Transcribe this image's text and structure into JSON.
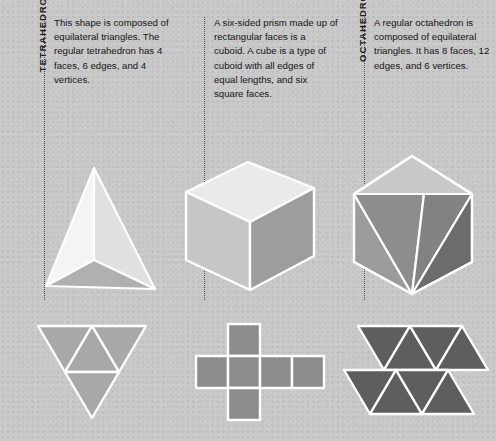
{
  "page": {
    "background_color": "#c9c9c9",
    "edge_color": "#ffffff",
    "divider_style": "dotted"
  },
  "columns": [
    {
      "id": "tetrahedron",
      "label": "TETRAHEDRON",
      "description": "This shape is composed of equilateral triangles. The regular tetrahedron has 4 faces, 6 edges, and 4 vertices.",
      "facts": {
        "faces": 4,
        "edges": 6,
        "vertices": 4
      },
      "solid": {
        "name": "tetrahedron-solid",
        "face_colors": [
          "#f2f2f2",
          "#e2e2e2",
          "#b3b3b3"
        ]
      },
      "net": {
        "name": "tetrahedron-net",
        "shape": "large downward triangle divided into four triangles",
        "fill": "#a8a8a8"
      }
    },
    {
      "id": "cube",
      "label": "CUBE",
      "description": "A six-sided prism made up of rectangular faces is a cuboid. A cube is a type of cuboid with all edges of equal lengths, and six square faces.",
      "facts": {
        "faces": 6,
        "edges": 12,
        "vertices": 8
      },
      "solid": {
        "name": "cube-solid",
        "face_colors": [
          "#e8e8e8",
          "#c4c4c4",
          "#9d9d9d"
        ]
      },
      "net": {
        "name": "cube-net",
        "shape": "cross of six squares",
        "fill": "#8c8c8c"
      }
    },
    {
      "id": "octahedron",
      "label": "OCTAHEDRON",
      "description": "A regular octahedron is composed of equilateral triangles. It has 8 faces, 12 edges, and 6 vertices.",
      "facts": {
        "faces": 8,
        "edges": 12,
        "vertices": 6
      },
      "solid": {
        "name": "octahedron-solid",
        "face_colors": [
          "#b5b5b5",
          "#9a9a9a",
          "#8a8a8a",
          "#6f6f6f"
        ]
      },
      "net": {
        "name": "octahedron-net",
        "shape": "zigzag strip of eight triangles",
        "fill": "#5e5e5e"
      }
    }
  ]
}
